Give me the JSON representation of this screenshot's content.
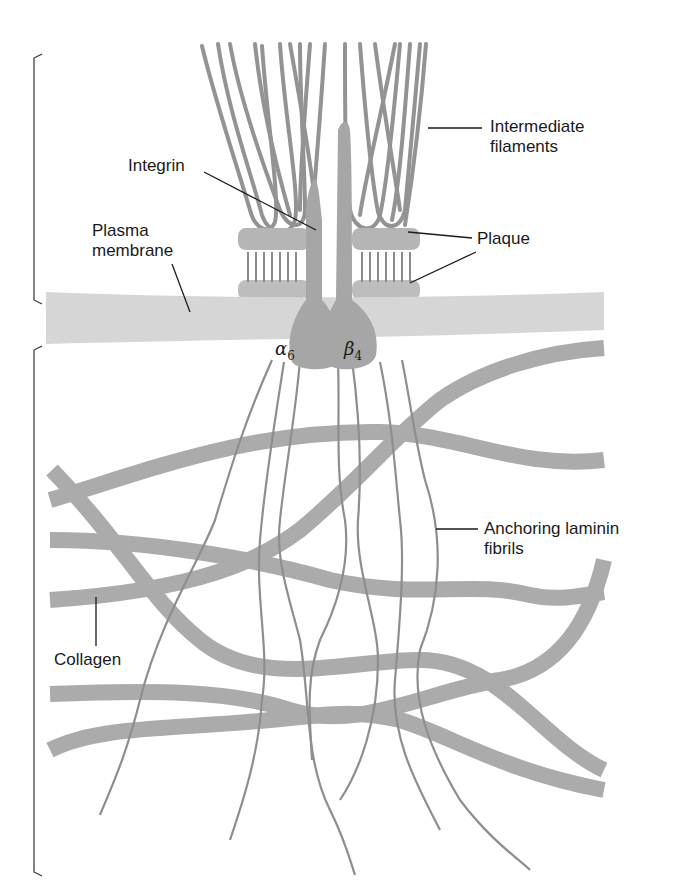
{
  "diagram": {
    "type": "hemidesmosome-structure",
    "labels": {
      "intermediate_filaments": [
        "Intermediate",
        "filaments"
      ],
      "integrin": "Integrin",
      "plasma_membrane": [
        "Plasma",
        "membrane"
      ],
      "plaque": "Plaque",
      "alpha_subunit": "α",
      "alpha_index": "6",
      "beta_subunit": "β",
      "beta_index": "4",
      "anchoring_fibrils": [
        "Anchoring laminin",
        "fibrils"
      ],
      "collagen": "Collagen"
    },
    "colors": {
      "structure_gray": "#a9a9a9",
      "filament_gray": "#8f8f8f",
      "membrane_gray": "#d6d6d6",
      "leader_line": "#1a1a1a"
    }
  }
}
